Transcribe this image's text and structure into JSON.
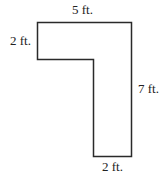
{
  "figure": {
    "shape": "L-shaped polygon (inverted L)",
    "stroke_color": "#2a2a2a",
    "fill_color": "#ffffff",
    "dimensions": {
      "top": "5 ft.",
      "left": "2 ft.",
      "right": "7 ft.",
      "bottom": "2 ft."
    }
  }
}
